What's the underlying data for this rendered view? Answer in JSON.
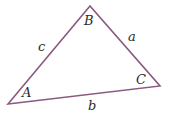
{
  "diagram": {
    "type": "triangle",
    "stroke_color": "#8a5a80",
    "vertices": {
      "A": {
        "label": "A",
        "x": 8,
        "y": 104
      },
      "B": {
        "label": "B",
        "x": 90,
        "y": 6
      },
      "C": {
        "label": "C",
        "x": 160,
        "y": 86
      }
    },
    "sides": {
      "a": {
        "label": "a",
        "between": "B-C"
      },
      "b": {
        "label": "b",
        "between": "A-C"
      },
      "c": {
        "label": "c",
        "between": "A-B"
      }
    }
  }
}
